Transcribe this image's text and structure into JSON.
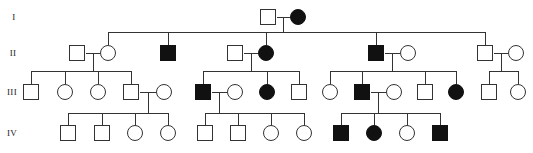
{
  "figure": {
    "type": "pedigree-chart",
    "width": 533,
    "height": 153,
    "background_color": "#ffffff",
    "line_color": "#333333",
    "affected_fill": "#111111",
    "unaffected_fill": "#ffffff",
    "symbol_legend": {
      "square": "male",
      "circle": "female",
      "filled": "affected",
      "open": "unaffected"
    }
  },
  "generations": [
    {
      "id": "I",
      "label": "I",
      "label_x": 14,
      "label_y": 17,
      "row_y": 17
    },
    {
      "id": "II",
      "label": "II",
      "label_x": 13,
      "label_y": 53,
      "row_y": 53
    },
    {
      "id": "III",
      "label": "III",
      "label_x": 12,
      "label_y": 92,
      "row_y": 92
    },
    {
      "id": "IV",
      "label": "IV",
      "label_x": 12,
      "label_y": 133,
      "row_y": 133
    }
  ],
  "individuals": [
    {
      "id": "I-1",
      "generation": "I",
      "sex": "male",
      "affected": false,
      "x": 268,
      "y": 17
    },
    {
      "id": "I-2",
      "generation": "I",
      "sex": "female",
      "affected": true,
      "x": 298,
      "y": 17
    },
    {
      "id": "II-1",
      "generation": "II",
      "sex": "male",
      "affected": false,
      "x": 77,
      "y": 53
    },
    {
      "id": "II-2",
      "generation": "II",
      "sex": "female",
      "affected": false,
      "x": 108,
      "y": 53
    },
    {
      "id": "II-3",
      "generation": "II",
      "sex": "male",
      "affected": true,
      "x": 168,
      "y": 53
    },
    {
      "id": "II-4",
      "generation": "II",
      "sex": "male",
      "affected": false,
      "x": 235,
      "y": 53
    },
    {
      "id": "II-5",
      "generation": "II",
      "sex": "female",
      "affected": true,
      "x": 266,
      "y": 53
    },
    {
      "id": "II-6",
      "generation": "II",
      "sex": "male",
      "affected": true,
      "x": 376,
      "y": 53
    },
    {
      "id": "II-7",
      "generation": "II",
      "sex": "female",
      "affected": false,
      "x": 408,
      "y": 53
    },
    {
      "id": "II-8",
      "generation": "II",
      "sex": "male",
      "affected": false,
      "x": 485,
      "y": 53
    },
    {
      "id": "II-9",
      "generation": "II",
      "sex": "female",
      "affected": false,
      "x": 516,
      "y": 53
    },
    {
      "id": "III-1",
      "generation": "III",
      "sex": "male",
      "affected": false,
      "x": 31,
      "y": 92
    },
    {
      "id": "III-2",
      "generation": "III",
      "sex": "female",
      "affected": false,
      "x": 65,
      "y": 92
    },
    {
      "id": "III-3",
      "generation": "III",
      "sex": "female",
      "affected": false,
      "x": 98,
      "y": 92
    },
    {
      "id": "III-4",
      "generation": "III",
      "sex": "male",
      "affected": false,
      "x": 131,
      "y": 92
    },
    {
      "id": "III-5",
      "generation": "III",
      "sex": "female",
      "affected": false,
      "x": 164,
      "y": 92
    },
    {
      "id": "III-6",
      "generation": "III",
      "sex": "male",
      "affected": true,
      "x": 203,
      "y": 92
    },
    {
      "id": "III-7",
      "generation": "III",
      "sex": "female",
      "affected": false,
      "x": 235,
      "y": 92
    },
    {
      "id": "III-8",
      "generation": "III",
      "sex": "female",
      "affected": true,
      "x": 267,
      "y": 92
    },
    {
      "id": "III-9",
      "generation": "III",
      "sex": "male",
      "affected": false,
      "x": 299,
      "y": 92
    },
    {
      "id": "III-10",
      "generation": "III",
      "sex": "female",
      "affected": false,
      "x": 330,
      "y": 92
    },
    {
      "id": "III-11",
      "generation": "III",
      "sex": "male",
      "affected": true,
      "x": 362,
      "y": 92
    },
    {
      "id": "III-12",
      "generation": "III",
      "sex": "female",
      "affected": false,
      "x": 394,
      "y": 92
    },
    {
      "id": "III-13",
      "generation": "III",
      "sex": "male",
      "affected": false,
      "x": 425,
      "y": 92
    },
    {
      "id": "III-14",
      "generation": "III",
      "sex": "female",
      "affected": true,
      "x": 456,
      "y": 92
    },
    {
      "id": "III-15",
      "generation": "III",
      "sex": "male",
      "affected": false,
      "x": 489,
      "y": 92
    },
    {
      "id": "III-16",
      "generation": "III",
      "sex": "female",
      "affected": false,
      "x": 518,
      "y": 92
    },
    {
      "id": "IV-1",
      "generation": "IV",
      "sex": "male",
      "affected": false,
      "x": 68,
      "y": 133
    },
    {
      "id": "IV-2",
      "generation": "IV",
      "sex": "male",
      "affected": false,
      "x": 102,
      "y": 133
    },
    {
      "id": "IV-3",
      "generation": "IV",
      "sex": "female",
      "affected": false,
      "x": 135,
      "y": 133
    },
    {
      "id": "IV-4",
      "generation": "IV",
      "sex": "female",
      "affected": false,
      "x": 168,
      "y": 133
    },
    {
      "id": "IV-5",
      "generation": "IV",
      "sex": "male",
      "affected": false,
      "x": 205,
      "y": 133
    },
    {
      "id": "IV-6",
      "generation": "IV",
      "sex": "male",
      "affected": false,
      "x": 238,
      "y": 133
    },
    {
      "id": "IV-7",
      "generation": "IV",
      "sex": "female",
      "affected": false,
      "x": 271,
      "y": 133
    },
    {
      "id": "IV-8",
      "generation": "IV",
      "sex": "female",
      "affected": false,
      "x": 304,
      "y": 133
    },
    {
      "id": "IV-9",
      "generation": "IV",
      "sex": "male",
      "affected": true,
      "x": 341,
      "y": 133
    },
    {
      "id": "IV-10",
      "generation": "IV",
      "sex": "female",
      "affected": true,
      "x": 374,
      "y": 133
    },
    {
      "id": "IV-11",
      "generation": "IV",
      "sex": "female",
      "affected": false,
      "x": 407,
      "y": 133
    },
    {
      "id": "IV-12",
      "generation": "IV",
      "sex": "male",
      "affected": true,
      "x": 440,
      "y": 133
    }
  ],
  "mating_lines": [
    {
      "id": "mate-I-1-2",
      "x1": 277,
      "x2": 290,
      "y": 17
    },
    {
      "id": "mate-II-1-2",
      "x1": 86,
      "x2": 100,
      "y": 53
    },
    {
      "id": "mate-II-4-5",
      "x1": 244,
      "x2": 258,
      "y": 53
    },
    {
      "id": "mate-II-6-7",
      "x1": 385,
      "x2": 400,
      "y": 53
    },
    {
      "id": "mate-II-8-9",
      "x1": 494,
      "x2": 508,
      "y": 53
    },
    {
      "id": "mate-III-4-5",
      "x1": 140,
      "x2": 156,
      "y": 92
    },
    {
      "id": "mate-III-6-7",
      "x1": 212,
      "x2": 227,
      "y": 92
    },
    {
      "id": "mate-III-11-12",
      "x1": 371,
      "x2": 386,
      "y": 92
    }
  ],
  "descent_lines": [
    {
      "id": "descent-I",
      "x": 283,
      "y1": 17,
      "y2": 32
    },
    {
      "id": "descent-II-1-2",
      "x": 93,
      "y1": 53,
      "y2": 71
    },
    {
      "id": "descent-II-4-5",
      "x": 251,
      "y1": 53,
      "y2": 71
    },
    {
      "id": "descent-II-6-7",
      "x": 392,
      "y1": 53,
      "y2": 71
    },
    {
      "id": "descent-II-8-9",
      "x": 501,
      "y1": 53,
      "y2": 71
    },
    {
      "id": "descent-III-4-5",
      "x": 148,
      "y1": 92,
      "y2": 113
    },
    {
      "id": "descent-III-6-7",
      "x": 219,
      "y1": 92,
      "y2": 113
    },
    {
      "id": "descent-III-11-12",
      "x": 378,
      "y1": 92,
      "y2": 113
    }
  ],
  "sibship_lines": [
    {
      "id": "sibship-II",
      "x1": 108,
      "x2": 485,
      "y": 32
    },
    {
      "id": "sibship-III-a",
      "x1": 31,
      "x2": 131,
      "y": 71
    },
    {
      "id": "sibship-III-b",
      "x1": 203,
      "x2": 299,
      "y": 71
    },
    {
      "id": "sibship-III-c",
      "x1": 330,
      "x2": 456,
      "y": 71
    },
    {
      "id": "sibship-III-d",
      "x1": 489,
      "x2": 518,
      "y": 71
    },
    {
      "id": "sibship-IV-a",
      "x1": 68,
      "x2": 168,
      "y": 113
    },
    {
      "id": "sibship-IV-b",
      "x1": 205,
      "x2": 304,
      "y": 113
    },
    {
      "id": "sibship-IV-c",
      "x1": 341,
      "x2": 440,
      "y": 113
    }
  ],
  "sib_drop_lines": [
    {
      "id": "drop-II-2",
      "x": 108,
      "y1": 32,
      "y2": 45
    },
    {
      "id": "drop-II-3",
      "x": 168,
      "y1": 32,
      "y2": 45
    },
    {
      "id": "drop-II-5",
      "x": 266,
      "y1": 32,
      "y2": 45
    },
    {
      "id": "drop-II-6",
      "x": 376,
      "y1": 32,
      "y2": 45
    },
    {
      "id": "drop-II-8",
      "x": 485,
      "y1": 32,
      "y2": 45
    },
    {
      "id": "drop-III-1",
      "x": 31,
      "y1": 71,
      "y2": 84
    },
    {
      "id": "drop-III-2",
      "x": 65,
      "y1": 71,
      "y2": 84
    },
    {
      "id": "drop-III-3",
      "x": 98,
      "y1": 71,
      "y2": 84
    },
    {
      "id": "drop-III-4",
      "x": 131,
      "y1": 71,
      "y2": 84
    },
    {
      "id": "drop-III-6",
      "x": 203,
      "y1": 71,
      "y2": 84
    },
    {
      "id": "drop-III-8",
      "x": 267,
      "y1": 71,
      "y2": 84
    },
    {
      "id": "drop-III-9",
      "x": 299,
      "y1": 71,
      "y2": 84
    },
    {
      "id": "drop-III-10",
      "x": 330,
      "y1": 71,
      "y2": 84
    },
    {
      "id": "drop-III-11",
      "x": 362,
      "y1": 71,
      "y2": 84
    },
    {
      "id": "drop-III-13",
      "x": 425,
      "y1": 71,
      "y2": 84
    },
    {
      "id": "drop-III-14",
      "x": 456,
      "y1": 71,
      "y2": 84
    },
    {
      "id": "drop-III-15",
      "x": 489,
      "y1": 71,
      "y2": 84
    },
    {
      "id": "drop-III-16",
      "x": 518,
      "y1": 71,
      "y2": 84
    },
    {
      "id": "drop-IV-1",
      "x": 68,
      "y1": 113,
      "y2": 126
    },
    {
      "id": "drop-IV-2",
      "x": 102,
      "y1": 113,
      "y2": 126
    },
    {
      "id": "drop-IV-3",
      "x": 135,
      "y1": 113,
      "y2": 126
    },
    {
      "id": "drop-IV-4",
      "x": 168,
      "y1": 113,
      "y2": 126
    },
    {
      "id": "drop-IV-5",
      "x": 205,
      "y1": 113,
      "y2": 126
    },
    {
      "id": "drop-IV-6",
      "x": 238,
      "y1": 113,
      "y2": 126
    },
    {
      "id": "drop-IV-7",
      "x": 271,
      "y1": 113,
      "y2": 126
    },
    {
      "id": "drop-IV-8",
      "x": 304,
      "y1": 113,
      "y2": 126
    },
    {
      "id": "drop-IV-9",
      "x": 341,
      "y1": 113,
      "y2": 126
    },
    {
      "id": "drop-IV-10",
      "x": 374,
      "y1": 113,
      "y2": 126
    },
    {
      "id": "drop-IV-11",
      "x": 407,
      "y1": 113,
      "y2": 126
    },
    {
      "id": "drop-IV-12",
      "x": 440,
      "y1": 113,
      "y2": 126
    }
  ],
  "symbol_size": {
    "square_side": 15,
    "circle_radius": 7.5
  }
}
